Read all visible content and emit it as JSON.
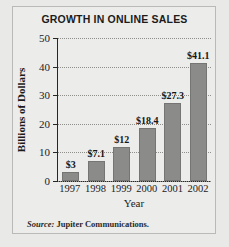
{
  "figure": {
    "background_color": "#e9e9e7",
    "frame_color": "#b9b9b5",
    "source_label": "Source:",
    "source_text": "Jupiter Communications."
  },
  "chart_data": {
    "type": "bar",
    "title": "GROWTH IN ONLINE SALES",
    "xlabel": "Year",
    "ylabel": "Billions of Dollars",
    "categories": [
      "1997",
      "1998",
      "1999",
      "2000",
      "2001",
      "2002"
    ],
    "values": [
      3,
      7.1,
      12,
      18.4,
      27.3,
      41.1
    ],
    "data_labels": [
      "$3",
      "$7.1",
      "$12",
      "$18.4",
      "$27.3",
      "$41.1"
    ],
    "ylim": [
      0,
      50
    ],
    "yticks": [
      0,
      10,
      20,
      30,
      40,
      50
    ],
    "ytick_labels": [
      "0",
      "10",
      "20",
      "30",
      "40",
      "50"
    ],
    "grid": true,
    "grid_style": "dotted",
    "legend": "none",
    "bar_color": "#8b8b89",
    "axis_color": "#272727"
  }
}
